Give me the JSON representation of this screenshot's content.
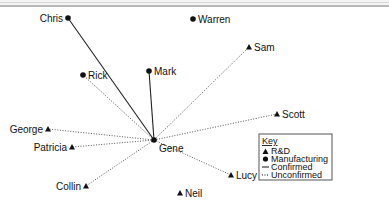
{
  "diagram": {
    "center": "Gene",
    "nodes": [
      {
        "id": "Chris",
        "type": "Manufacturing"
      },
      {
        "id": "Warren",
        "type": "Manufacturing"
      },
      {
        "id": "Sam",
        "type": "R&D"
      },
      {
        "id": "Rick",
        "type": "Manufacturing"
      },
      {
        "id": "Mark",
        "type": "Manufacturing"
      },
      {
        "id": "Scott",
        "type": "R&D"
      },
      {
        "id": "George",
        "type": "R&D"
      },
      {
        "id": "Patricia",
        "type": "R&D"
      },
      {
        "id": "Gene",
        "type": "Manufacturing"
      },
      {
        "id": "Collin",
        "type": "R&D"
      },
      {
        "id": "Neil",
        "type": "R&D"
      },
      {
        "id": "Lucy",
        "type": "R&D"
      }
    ],
    "edges": [
      {
        "from": "Gene",
        "to": "Chris",
        "status": "Confirmed"
      },
      {
        "from": "Gene",
        "to": "Mark",
        "status": "Confirmed"
      },
      {
        "from": "Gene",
        "to": "Rick",
        "status": "Unconfirmed"
      },
      {
        "from": "Gene",
        "to": "Sam",
        "status": "Unconfirmed"
      },
      {
        "from": "Gene",
        "to": "Scott",
        "status": "Unconfirmed"
      },
      {
        "from": "Gene",
        "to": "George",
        "status": "Unconfirmed"
      },
      {
        "from": "Gene",
        "to": "Patricia",
        "status": "Unconfirmed"
      },
      {
        "from": "Gene",
        "to": "Collin",
        "status": "Unconfirmed"
      },
      {
        "from": "Gene",
        "to": "Lucy",
        "status": "Unconfirmed"
      }
    ]
  },
  "legend": {
    "title": "Key",
    "items": [
      {
        "symbol": "triangle",
        "label": "R&D"
      },
      {
        "symbol": "circle",
        "label": "Manufacturing"
      },
      {
        "symbol": "solid-line",
        "label": "Confirmed"
      },
      {
        "symbol": "dotted-line",
        "label": "Unconfirmed"
      }
    ]
  },
  "colors": {
    "ink": "#111111",
    "edge": "#444444",
    "legend_border": "#555555"
  }
}
